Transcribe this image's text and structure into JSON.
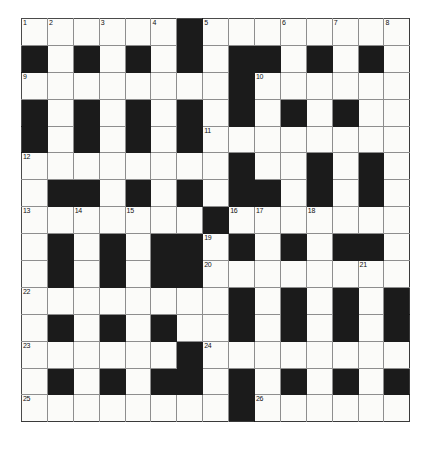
{
  "puzzle": {
    "type": "crossword-grid",
    "title": "Crossword Puzzle Grid",
    "rows": 15,
    "cols": 15,
    "colors": {
      "block": "#1b1b1b",
      "open": "#fbfbf9",
      "gridline": "#8e8e8e",
      "border": "#4a4a4a",
      "number": "#111111",
      "page_background": "#ffffff"
    },
    "grid": [
      [
        1,
        1,
        1,
        1,
        1,
        1,
        0,
        1,
        1,
        1,
        1,
        1,
        1,
        1,
        1
      ],
      [
        0,
        1,
        0,
        1,
        0,
        1,
        0,
        1,
        0,
        0,
        1,
        0,
        1,
        0,
        1
      ],
      [
        1,
        1,
        1,
        1,
        1,
        1,
        1,
        1,
        0,
        1,
        1,
        1,
        1,
        1,
        1
      ],
      [
        0,
        1,
        0,
        1,
        0,
        1,
        0,
        1,
        0,
        1,
        0,
        1,
        0,
        1,
        1
      ],
      [
        0,
        1,
        0,
        1,
        0,
        1,
        0,
        1,
        1,
        1,
        1,
        1,
        1,
        1,
        1
      ],
      [
        1,
        1,
        1,
        1,
        1,
        1,
        1,
        1,
        0,
        1,
        1,
        0,
        1,
        0,
        1
      ],
      [
        1,
        0,
        0,
        1,
        0,
        1,
        0,
        1,
        0,
        0,
        1,
        0,
        1,
        0,
        1
      ],
      [
        1,
        1,
        1,
        1,
        1,
        1,
        1,
        0,
        1,
        1,
        1,
        1,
        1,
        1,
        1
      ],
      [
        1,
        0,
        1,
        0,
        1,
        0,
        0,
        1,
        0,
        1,
        0,
        1,
        0,
        0,
        1
      ],
      [
        1,
        0,
        1,
        0,
        1,
        0,
        0,
        1,
        1,
        1,
        1,
        1,
        1,
        1,
        1
      ],
      [
        1,
        1,
        1,
        1,
        1,
        1,
        1,
        1,
        0,
        1,
        0,
        1,
        0,
        1,
        0
      ],
      [
        1,
        0,
        1,
        0,
        1,
        0,
        1,
        1,
        0,
        1,
        0,
        1,
        0,
        1,
        0
      ],
      [
        1,
        1,
        1,
        1,
        1,
        1,
        0,
        1,
        1,
        1,
        1,
        1,
        1,
        1,
        1
      ],
      [
        1,
        0,
        1,
        0,
        1,
        0,
        0,
        1,
        0,
        1,
        0,
        1,
        0,
        1,
        0
      ],
      [
        1,
        1,
        1,
        1,
        1,
        1,
        1,
        1,
        0,
        1,
        1,
        1,
        1,
        1,
        1
      ]
    ],
    "numbers": [
      {
        "row": 0,
        "col": 0,
        "label": "1"
      },
      {
        "row": 0,
        "col": 1,
        "label": "2"
      },
      {
        "row": 0,
        "col": 3,
        "label": "3"
      },
      {
        "row": 0,
        "col": 5,
        "label": "4"
      },
      {
        "row": 0,
        "col": 7,
        "label": "5"
      },
      {
        "row": 0,
        "col": 10,
        "label": "6"
      },
      {
        "row": 0,
        "col": 12,
        "label": "7"
      },
      {
        "row": 0,
        "col": 14,
        "label": "8"
      },
      {
        "row": 2,
        "col": 0,
        "label": "9"
      },
      {
        "row": 2,
        "col": 9,
        "label": "10"
      },
      {
        "row": 4,
        "col": 7,
        "label": "11"
      },
      {
        "row": 5,
        "col": 0,
        "label": "12"
      },
      {
        "row": 7,
        "col": 0,
        "label": "13"
      },
      {
        "row": 7,
        "col": 2,
        "label": "14"
      },
      {
        "row": 7,
        "col": 4,
        "label": "15"
      },
      {
        "row": 7,
        "col": 8,
        "label": "16"
      },
      {
        "row": 7,
        "col": 9,
        "label": "17"
      },
      {
        "row": 7,
        "col": 11,
        "label": "18"
      },
      {
        "row": 8,
        "col": 7,
        "label": "19"
      },
      {
        "row": 9,
        "col": 7,
        "label": "20"
      },
      {
        "row": 9,
        "col": 13,
        "label": "21"
      },
      {
        "row": 10,
        "col": 0,
        "label": "22"
      },
      {
        "row": 12,
        "col": 0,
        "label": "23"
      },
      {
        "row": 12,
        "col": 7,
        "label": "24"
      },
      {
        "row": 14,
        "col": 0,
        "label": "25"
      },
      {
        "row": 14,
        "col": 9,
        "label": "26"
      }
    ]
  }
}
